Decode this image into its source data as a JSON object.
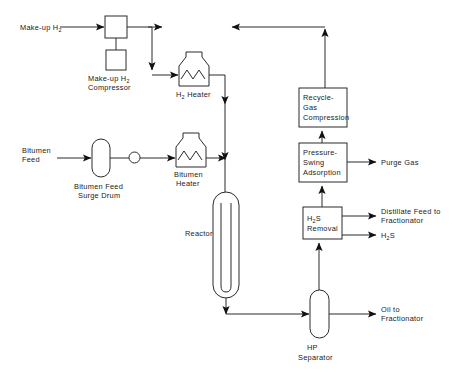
{
  "diagram": {
    "type": "process-flow-diagram",
    "width": 455,
    "height": 382,
    "background_color": "#ffffff",
    "line_color": "#2a2a2a",
    "text_color": "#1a1a1a"
  },
  "units": [
    {
      "id": "makeup-h2-compressor",
      "label_lines": [
        "Make-up H",
        "Compressor"
      ],
      "label_sub": "2",
      "shape": "square-with-drive",
      "x": 105,
      "y": 16,
      "w": 22,
      "h": 22
    },
    {
      "id": "h2-heater",
      "label_lines": [
        "H",
        " Heater"
      ],
      "label_sub": "2",
      "shape": "furnace",
      "x": 179,
      "y": 52,
      "w": 30,
      "h": 34
    },
    {
      "id": "bitumen-feed-surge-drum",
      "label_lines": [
        "Bitumen Feed",
        "Surge Drum"
      ],
      "shape": "vertical-capsule",
      "x": 92,
      "y": 139,
      "w": 18,
      "h": 38
    },
    {
      "id": "feed-pump",
      "label_lines": [],
      "shape": "circle-pump",
      "x": 129,
      "y": 152,
      "w": 11,
      "h": 11
    },
    {
      "id": "bitumen-heater",
      "label_lines": [
        "Bitumen",
        "Heater"
      ],
      "shape": "furnace",
      "x": 176,
      "y": 133,
      "w": 30,
      "h": 34
    },
    {
      "id": "reactor",
      "label_lines": [
        "Reactor"
      ],
      "shape": "reactor-capsule",
      "x": 213,
      "y": 192,
      "w": 26,
      "h": 106
    },
    {
      "id": "recycle-gas-compression",
      "label_lines": [
        "Recycle-",
        "Gas",
        "Compression"
      ],
      "shape": "box",
      "x": 299,
      "y": 88,
      "w": 48,
      "h": 39
    },
    {
      "id": "pressure-swing-adsorption",
      "label_lines": [
        "Pressure-",
        "Swing",
        "Adsorption"
      ],
      "shape": "box",
      "x": 299,
      "y": 143,
      "w": 48,
      "h": 39
    },
    {
      "id": "h2s-removal",
      "label_lines": [
        "H",
        "S",
        "Removal"
      ],
      "label_sub": "2",
      "shape": "box",
      "x": 303,
      "y": 207,
      "w": 39,
      "h": 32
    },
    {
      "id": "hp-separator",
      "label_lines": [
        "HP",
        "Separator"
      ],
      "shape": "vertical-capsule",
      "x": 310,
      "y": 290,
      "w": 19,
      "h": 48
    }
  ],
  "streams": {
    "makeup_h2_feed": "Make-up H",
    "makeup_h2_feed_sub": "2",
    "bitumen_feed_l1": "Bitumen",
    "bitumen_feed_l2": "Feed",
    "purge_gas": "Purge Gas",
    "distillate_feed_l1": "Distillate Feed to",
    "distillate_feed_l2": "Fractionator",
    "h2s_product": "H",
    "h2s_product_sub": "2",
    "h2s_product_tail": "S",
    "oil_to_fractionator_l1": "Oil to",
    "oil_to_fractionator_l2": "Fractionator"
  },
  "unit_labels": {
    "makeup_compressor_l1_pre": "Make-up H",
    "makeup_compressor_l1_sub": "2",
    "makeup_compressor_l2": "Compressor",
    "h2_heater_pre": "H",
    "h2_heater_sub": "2",
    "h2_heater_post": " Heater",
    "surge_drum_l1": "Bitumen Feed",
    "surge_drum_l2": "Surge Drum",
    "bitumen_heater_l1": "Bitumen",
    "bitumen_heater_l2": "Heater",
    "reactor": "Reactor",
    "rgc_l1": "Recycle-",
    "rgc_l2": "Gas",
    "rgc_l3": "Compression",
    "psa_l1": "Pressure-",
    "psa_l2": "Swing",
    "psa_l3": "Adsorption",
    "h2s_removal_pre": "H",
    "h2s_removal_sub": "2",
    "h2s_removal_post": "S",
    "h2s_removal_l2": "Removal",
    "hp_sep_l1": "HP",
    "hp_sep_l2": "Separator"
  }
}
